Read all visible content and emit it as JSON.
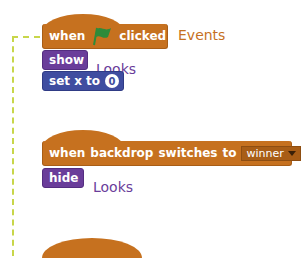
{
  "scripts": [
    {
      "hat": {
        "parts": [
          "when",
          "clicked"
        ],
        "icon": "green-flag-icon",
        "category_label": "Events"
      },
      "stack": [
        {
          "label": "show",
          "category_label": "Looks"
        },
        {
          "label": "set x to",
          "input_value": "0"
        }
      ]
    },
    {
      "hat": {
        "parts": [
          "when",
          "backdrop",
          "switches",
          "to"
        ],
        "dropdown_value": "winner"
      },
      "stack": [
        {
          "label": "hide",
          "category_label": "Looks"
        }
      ]
    }
  ],
  "colors": {
    "events": "#c6711f",
    "looks": "#6a3d9a",
    "motion": "#3f4da0",
    "flag": "#2e8b3a",
    "connector": "#c8d64a"
  }
}
